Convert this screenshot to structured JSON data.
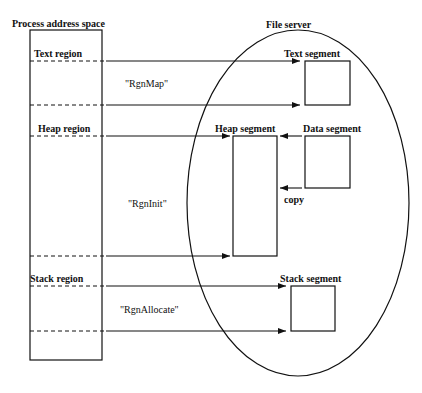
{
  "diagram": {
    "left_title": "Process address space",
    "right_title": "File server",
    "regions": [
      {
        "label": "Text region"
      },
      {
        "label": "Heap region"
      },
      {
        "label": "Stack region"
      }
    ],
    "calls": [
      {
        "label": "\"RgnMap\""
      },
      {
        "label": "\"RgnInit\""
      },
      {
        "label": "\"RgnAllocate\""
      }
    ],
    "segments": [
      {
        "label": "Text segment"
      },
      {
        "label": "Heap segment"
      },
      {
        "label": "Data segment"
      },
      {
        "label": "Stack segment"
      }
    ],
    "copy_label": "copy",
    "colors": {
      "stroke": "#111111",
      "background": "#ffffff"
    }
  }
}
